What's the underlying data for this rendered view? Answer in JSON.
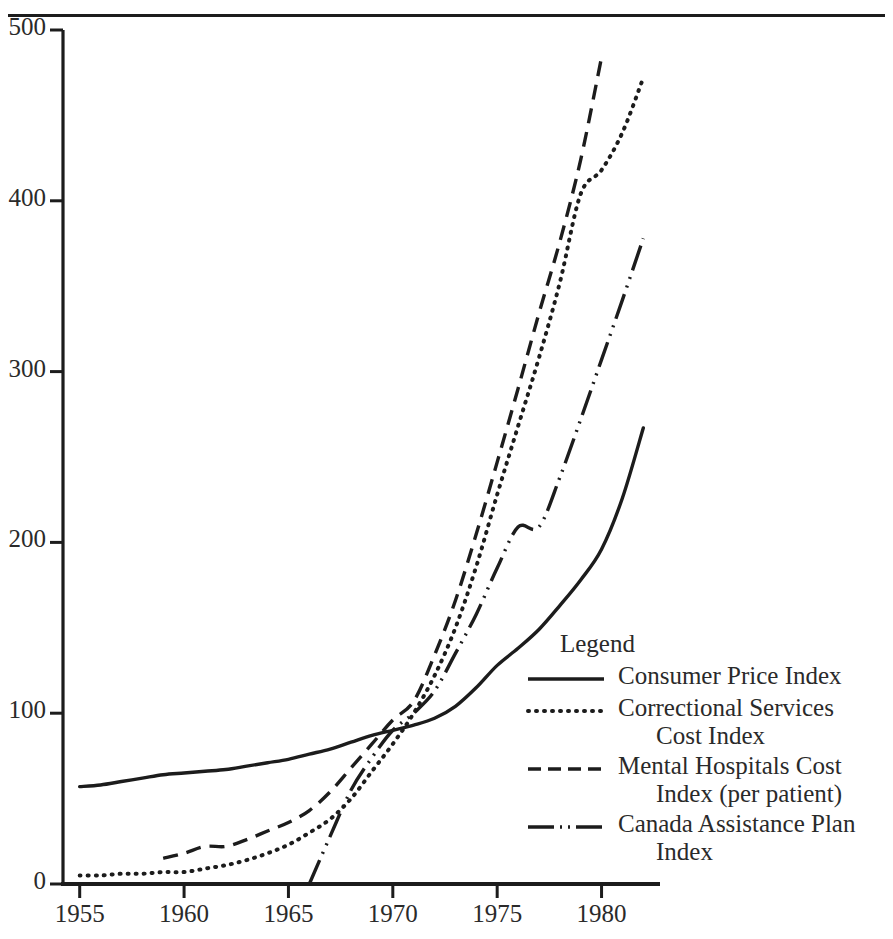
{
  "figure": {
    "has_top_rule": true,
    "background": "#ffffff",
    "ink_color": "#1c1c1c"
  },
  "legend": {
    "title": "Legend",
    "entries": [
      {
        "style": "solid",
        "line1": "Consumer Price Index",
        "line2": ""
      },
      {
        "style": "dotted",
        "line1": "Correctional Services",
        "line2": "Cost Index"
      },
      {
        "style": "dashed",
        "line1": "Mental Hospitals Cost",
        "line2": "Index (per patient)"
      },
      {
        "style": "dash-dot-dot",
        "line1": "Canada Assistance Plan",
        "line2": "Index"
      }
    ]
  },
  "chart_data": {
    "type": "line",
    "title": "",
    "xlabel": "",
    "ylabel": "",
    "xlim": [
      1954.2,
      1982.8
    ],
    "ylim": [
      0,
      500
    ],
    "grid": false,
    "legend_position": "inside-right",
    "yticks": [
      0,
      100,
      200,
      300,
      400,
      500
    ],
    "ytick_labels": [
      "0",
      "100",
      "200",
      "300",
      "400",
      "500"
    ],
    "xticks": [
      1955,
      1960,
      1965,
      1970,
      1975,
      1980
    ],
    "xtick_labels": [
      "1955",
      "1960",
      "1965",
      "1970",
      "1975",
      "1980"
    ],
    "series": [
      {
        "name": "Consumer Price Index",
        "style": "solid",
        "color": "#1c1c1c",
        "x": [
          1955,
          1956,
          1957,
          1958,
          1959,
          1960,
          1961,
          1962,
          1963,
          1964,
          1965,
          1966,
          1967,
          1968,
          1969,
          1970,
          1971,
          1972,
          1973,
          1974,
          1975,
          1976,
          1977,
          1978,
          1979,
          1980,
          1981,
          1982
        ],
        "y": [
          57,
          58,
          60,
          62,
          64,
          65,
          66,
          67,
          69,
          71,
          73,
          76,
          79,
          83,
          87,
          90,
          93,
          97,
          104,
          115,
          128,
          138,
          149,
          163,
          178,
          196,
          226,
          267
        ]
      },
      {
        "name": "Correctional Services Cost Index",
        "style": "dotted",
        "color": "#1c1c1c",
        "x": [
          1955,
          1956,
          1957,
          1958,
          1959,
          1960,
          1961,
          1962,
          1963,
          1964,
          1965,
          1966,
          1967,
          1968,
          1969,
          1970,
          1971,
          1972,
          1973,
          1974,
          1975,
          1976,
          1977,
          1978,
          1979,
          1980,
          1981,
          1982
        ],
        "y": [
          5,
          5,
          6,
          6,
          7,
          7,
          9,
          11,
          14,
          18,
          23,
          30,
          38,
          50,
          66,
          82,
          100,
          122,
          150,
          186,
          228,
          268,
          308,
          352,
          404,
          418,
          440,
          472
        ]
      },
      {
        "name": "Mental Hospitals Cost Index (per patient)",
        "style": "dashed",
        "color": "#1c1c1c",
        "x": [
          1959,
          1960,
          1961,
          1962,
          1963,
          1964,
          1965,
          1966,
          1967,
          1968,
          1969,
          1970,
          1971,
          1972,
          1973,
          1974,
          1975,
          1976,
          1977,
          1978,
          1979,
          1980
        ],
        "y": [
          15,
          18,
          22,
          22,
          26,
          31,
          36,
          43,
          54,
          68,
          82,
          96,
          107,
          134,
          166,
          205,
          247,
          290,
          334,
          376,
          424,
          484
        ]
      },
      {
        "name": "Canada Assistance Plan Index",
        "style": "dash-dot-dot",
        "color": "#1c1c1c",
        "x": [
          1966,
          1967,
          1968,
          1969,
          1970,
          1971,
          1972,
          1973,
          1974,
          1975,
          1976,
          1977,
          1978,
          1979,
          1980,
          1981,
          1982
        ],
        "y": [
          0,
          28,
          55,
          74,
          90,
          100,
          113,
          135,
          158,
          185,
          209,
          209,
          238,
          272,
          307,
          342,
          378
        ]
      }
    ]
  }
}
